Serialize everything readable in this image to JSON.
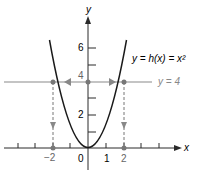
{
  "figure": {
    "function_label": "y = h(x) = x²",
    "line_label": "y = 4",
    "x_axis_label": "x",
    "y_axis_label": "y",
    "x_ticks": [
      "−2",
      "0",
      "1",
      "2"
    ],
    "y_ticks": [
      "2",
      "4",
      "6"
    ],
    "colors": {
      "curve": "#1a1a1a",
      "axis": "#2a2a2a",
      "line": "#8a8a8a",
      "points": "#777777"
    }
  }
}
